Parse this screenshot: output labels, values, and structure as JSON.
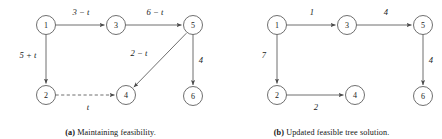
{
  "figure": {
    "subfigures": [
      {
        "id": "a",
        "caption_tag": "(a)",
        "caption_text": "Maintaining feasibility.",
        "nodes": [
          {
            "id": "n1",
            "label": "1",
            "cx": 46,
            "cy": 25
          },
          {
            "id": "n3",
            "label": "3",
            "cx": 116,
            "cy": 25
          },
          {
            "id": "n5",
            "label": "5",
            "cx": 193,
            "cy": 25
          },
          {
            "id": "n2",
            "label": "2",
            "cx": 46,
            "cy": 95
          },
          {
            "id": "n4",
            "label": "4",
            "cx": 126,
            "cy": 95
          },
          {
            "id": "n6",
            "label": "6",
            "cx": 193,
            "cy": 96
          }
        ],
        "edges": [
          {
            "id": "e13",
            "from": "n1",
            "to": "n3",
            "label": "3 − t",
            "style": "solid",
            "lx": 81,
            "ly": 15
          },
          {
            "id": "e35",
            "from": "n3",
            "to": "n5",
            "label": "6 − t",
            "style": "solid",
            "lx": 155,
            "ly": 15
          },
          {
            "id": "e12",
            "from": "n1",
            "to": "n2",
            "label": "5 + t",
            "style": "solid",
            "lx": 28,
            "ly": 58
          },
          {
            "id": "e24",
            "from": "n2",
            "to": "n4",
            "label": "t",
            "style": "dashed",
            "lx": 88,
            "ly": 110
          },
          {
            "id": "e54",
            "from": "n5",
            "to": "n4",
            "label": "2 − t",
            "style": "solid",
            "lx": 139,
            "ly": 56
          },
          {
            "id": "e56",
            "from": "n5",
            "to": "n6",
            "label": "4",
            "style": "solid",
            "lx": 201,
            "ly": 63
          }
        ]
      },
      {
        "id": "b",
        "caption_tag": "(b)",
        "caption_text": "Updated feasible tree solution.",
        "nodes": [
          {
            "id": "n1",
            "label": "1",
            "cx": 277,
            "cy": 25
          },
          {
            "id": "n3",
            "label": "3",
            "cx": 347,
            "cy": 25
          },
          {
            "id": "n5",
            "label": "5",
            "cx": 423,
            "cy": 25
          },
          {
            "id": "n2",
            "label": "2",
            "cx": 277,
            "cy": 95
          },
          {
            "id": "n4",
            "label": "4",
            "cx": 355,
            "cy": 95
          },
          {
            "id": "n6",
            "label": "6",
            "cx": 423,
            "cy": 96
          }
        ],
        "edges": [
          {
            "id": "e13",
            "from": "n1",
            "to": "n3",
            "label": "1",
            "style": "solid",
            "lx": 312,
            "ly": 15
          },
          {
            "id": "e35",
            "from": "n3",
            "to": "n5",
            "label": "4",
            "style": "solid",
            "lx": 386,
            "ly": 15
          },
          {
            "id": "e12",
            "from": "n1",
            "to": "n2",
            "label": "7",
            "style": "solid",
            "lx": 264,
            "ly": 58
          },
          {
            "id": "e24",
            "from": "n2",
            "to": "n4",
            "label": "2",
            "style": "solid",
            "lx": 316,
            "ly": 110
          },
          {
            "id": "e56",
            "from": "n5",
            "to": "n6",
            "label": "4",
            "style": "solid",
            "lx": 431,
            "ly": 63
          }
        ]
      }
    ],
    "node_radius": 9.5,
    "colors": {
      "stroke": "#4a4a4a",
      "text": "#1a1a1a",
      "background": "#ffffff"
    }
  }
}
